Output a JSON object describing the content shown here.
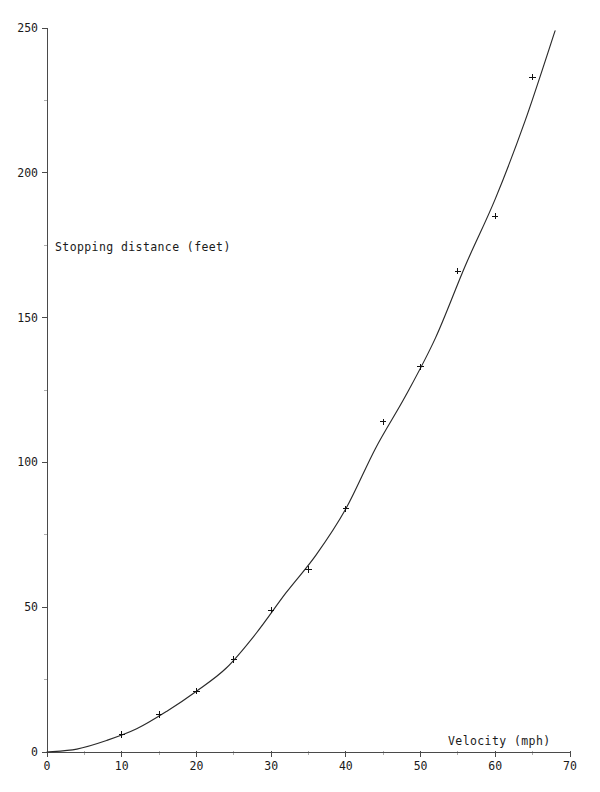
{
  "chart_data": {
    "type": "scatter",
    "title": "",
    "subtitle": "",
    "xlabel": "Velocity (mph)",
    "ylabel": "Stopping distance (feet)",
    "xlim": [
      0,
      70
    ],
    "ylim": [
      0,
      250
    ],
    "grid": false,
    "legend": null,
    "x_ticks": [
      0,
      10,
      20,
      30,
      40,
      50,
      60,
      70
    ],
    "x_tick_labels": [
      "0",
      "10",
      "20",
      "30",
      "40",
      "50",
      "60",
      "70"
    ],
    "x_minor_ticks": [
      5,
      15,
      25,
      35,
      45,
      55,
      65
    ],
    "y_ticks": [
      0,
      50,
      100,
      150,
      200,
      250
    ],
    "y_tick_labels": [
      "0",
      "50",
      "100",
      "150",
      "200",
      "250"
    ],
    "y_minor_ticks": [
      25,
      75,
      125,
      175,
      225
    ],
    "marker_symbol": "plus",
    "marker_color": "#111111",
    "curve_color": "#2a2a2a",
    "axis_color": "#4a4a4a",
    "x": [
      10,
      15,
      20,
      25,
      30,
      35,
      40,
      45,
      50,
      55,
      60,
      65
    ],
    "y": [
      6,
      13,
      21,
      32,
      49,
      63,
      84,
      114,
      133,
      166,
      185,
      233
    ],
    "series": [
      {
        "name": "Measured stopping distance",
        "marker": "plus",
        "points": [
          {
            "x": 10,
            "y": 6
          },
          {
            "x": 15,
            "y": 13
          },
          {
            "x": 20,
            "y": 21
          },
          {
            "x": 25,
            "y": 32
          },
          {
            "x": 30,
            "y": 49
          },
          {
            "x": 35,
            "y": 63
          },
          {
            "x": 40,
            "y": 84
          },
          {
            "x": 45,
            "y": 114
          },
          {
            "x": 50,
            "y": 133
          },
          {
            "x": 55,
            "y": 166
          },
          {
            "x": 60,
            "y": 185
          },
          {
            "x": 65,
            "y": 233
          }
        ]
      },
      {
        "name": "Fitted curve",
        "marker": "none",
        "points": [
          {
            "x": 0,
            "y": 0
          },
          {
            "x": 4,
            "y": 1
          },
          {
            "x": 8,
            "y": 4
          },
          {
            "x": 12,
            "y": 8
          },
          {
            "x": 16,
            "y": 14
          },
          {
            "x": 20,
            "y": 21
          },
          {
            "x": 24,
            "y": 29
          },
          {
            "x": 28,
            "y": 41
          },
          {
            "x": 32,
            "y": 55
          },
          {
            "x": 36,
            "y": 68
          },
          {
            "x": 40,
            "y": 84
          },
          {
            "x": 44,
            "y": 105
          },
          {
            "x": 48,
            "y": 123
          },
          {
            "x": 52,
            "y": 143
          },
          {
            "x": 56,
            "y": 168
          },
          {
            "x": 60,
            "y": 191
          },
          {
            "x": 64,
            "y": 218
          },
          {
            "x": 68,
            "y": 249
          }
        ]
      }
    ]
  },
  "axes": {
    "y_axis_title": "Stopping distance (feet)",
    "x_axis_title": "Velocity (mph)"
  }
}
